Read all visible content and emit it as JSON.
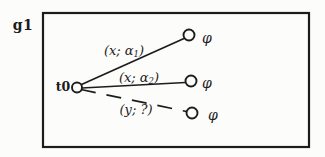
{
  "figure": {
    "title_label": "g1",
    "source_node": {
      "label": "t0"
    },
    "edges": [
      {
        "label_open": "(x; α",
        "label_sub": "1",
        "label_close": ")",
        "style": "solid",
        "target_label": "φ"
      },
      {
        "label_open": "(x; α",
        "label_sub": "2",
        "label_close": ")",
        "style": "solid",
        "target_label": "φ"
      },
      {
        "label_open": "(y; ?",
        "label_sub": "",
        "label_close": ")",
        "style": "dashed",
        "target_label": "φ"
      }
    ],
    "colors": {
      "ink": "#1c1c1c",
      "paper": "#fcfcfb"
    }
  }
}
